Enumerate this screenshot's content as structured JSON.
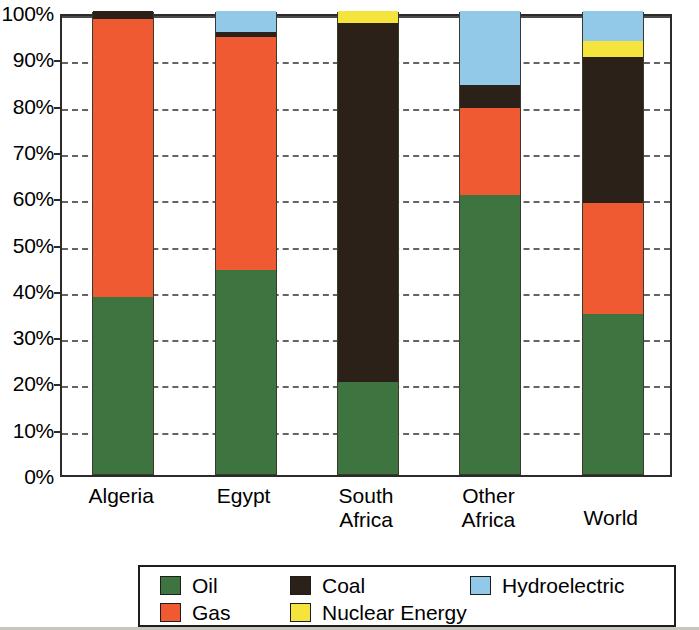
{
  "chart_data": {
    "type": "bar",
    "subtype": "stacked-percentage",
    "title": "",
    "xlabel": "",
    "ylabel": "",
    "ylim": [
      0,
      100
    ],
    "grid": true,
    "legend_position": "bottom",
    "categories": [
      "Algeria",
      "Egypt",
      "South\nAfrica",
      "Other\nAfrica",
      "World"
    ],
    "ytick_labels": [
      "0%",
      "10%",
      "20%",
      "30%",
      "40%",
      "50%",
      "60%",
      "70%",
      "80%",
      "90%",
      "100%"
    ],
    "ytick_values": [
      0,
      10,
      20,
      30,
      40,
      50,
      60,
      70,
      80,
      90,
      100
    ],
    "series": [
      {
        "name": "Oil",
        "color": "#3d7440",
        "values": [
          38.2,
          44.0,
          19.8,
          60.3,
          34.5
        ]
      },
      {
        "name": "Gas",
        "color": "#ef5a32",
        "values": [
          60.0,
          50.3,
          0.0,
          18.7,
          24.0
        ]
      },
      {
        "name": "Coal",
        "color": "#2b2119",
        "values": [
          1.8,
          1.2,
          77.7,
          5.0,
          31.5
        ]
      },
      {
        "name": "Nuclear Energy",
        "color": "#f5e43c",
        "values": [
          0.0,
          0.0,
          2.5,
          0.0,
          3.5
        ]
      },
      {
        "name": "Hydroelectric",
        "color": "#92c9e8",
        "values": [
          0.0,
          4.5,
          0.0,
          16.0,
          6.5
        ]
      }
    ]
  },
  "axis": {
    "y_labels": [
      "100%",
      "90%",
      "80%",
      "70%",
      "60%",
      "50%",
      "40%",
      "30%",
      "20%",
      "10%",
      "0%"
    ]
  },
  "legend": {
    "entries": [
      {
        "label": "Oil",
        "color": "#3d7440"
      },
      {
        "label": "Coal",
        "color": "#2b2119"
      },
      {
        "label": "Hydroelectric",
        "color": "#92c9e8"
      },
      {
        "label": "Gas",
        "color": "#ef5a32"
      },
      {
        "label": "Nuclear Energy",
        "color": "#f5e43c"
      }
    ]
  }
}
